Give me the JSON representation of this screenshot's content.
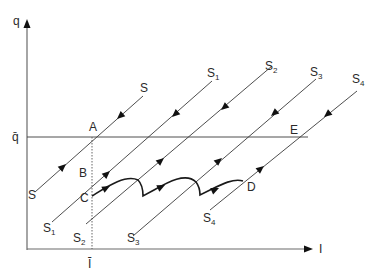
{
  "diagram": {
    "type": "phase-diagram",
    "axes": {
      "y_label": "q",
      "x_label": "I",
      "y_ref_label": "q̄",
      "x_ref_label": "Ī"
    },
    "points": {
      "A": "A",
      "B": "B",
      "C": "C",
      "D": "D",
      "E": "E"
    },
    "curves": [
      {
        "name": "S",
        "label": "S",
        "sub": ""
      },
      {
        "name": "S1",
        "label": "S",
        "sub": "1"
      },
      {
        "name": "S2",
        "label": "S",
        "sub": "2"
      },
      {
        "name": "S3",
        "label": "S",
        "sub": "3"
      },
      {
        "name": "S4",
        "label": "S",
        "sub": "4"
      }
    ]
  }
}
